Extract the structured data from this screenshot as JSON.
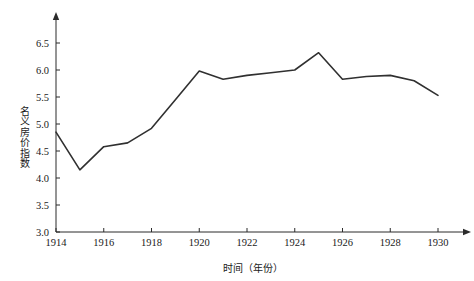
{
  "chart_data": {
    "type": "line",
    "title": "",
    "xlabel": "时间（年份）",
    "ylabel": "名义房价指数",
    "xlim": [
      1914,
      1930
    ],
    "ylim": [
      3.0,
      6.75
    ],
    "grid": false,
    "legend": null,
    "x_ticks": [
      "1914",
      "1916",
      "1918",
      "1920",
      "1922",
      "1924",
      "1926",
      "1928",
      "1930"
    ],
    "y_ticks": [
      "3.0",
      "3.5",
      "4.0",
      "4.5",
      "5.0",
      "5.5",
      "6.0",
      "6.5"
    ],
    "line_color": "#303030",
    "axis_color": "#2b2b2b",
    "x": [
      1914,
      1915,
      1916,
      1917,
      1918,
      1919,
      1920,
      1921,
      1922,
      1923,
      1924,
      1925,
      1926,
      1927,
      1928,
      1929,
      1930
    ],
    "series": [
      {
        "name": "名义房价指数",
        "values": [
          4.85,
          4.15,
          4.58,
          4.65,
          4.92,
          5.45,
          5.98,
          5.83,
          5.9,
          5.95,
          6.0,
          6.32,
          5.83,
          5.88,
          5.9,
          5.8,
          5.53
        ]
      }
    ]
  }
}
